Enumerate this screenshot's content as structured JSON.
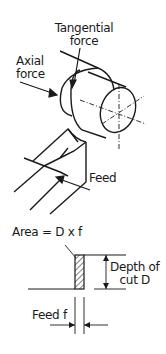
{
  "turning_diagram": {
    "labels": {
      "tangential_force_line1": "Tangential",
      "tangential_force_line2": "force",
      "axial_force_line1": "Axial",
      "axial_force_line2": "force",
      "feed": "Feed"
    }
  },
  "cut_section_diagram": {
    "labels": {
      "area": "Area = D x f",
      "depth_line1": "Depth of",
      "depth_line2": "cut D",
      "feed": "Feed f"
    }
  },
  "colors": {
    "line": "#1a1a1a",
    "background": "#ffffff"
  }
}
